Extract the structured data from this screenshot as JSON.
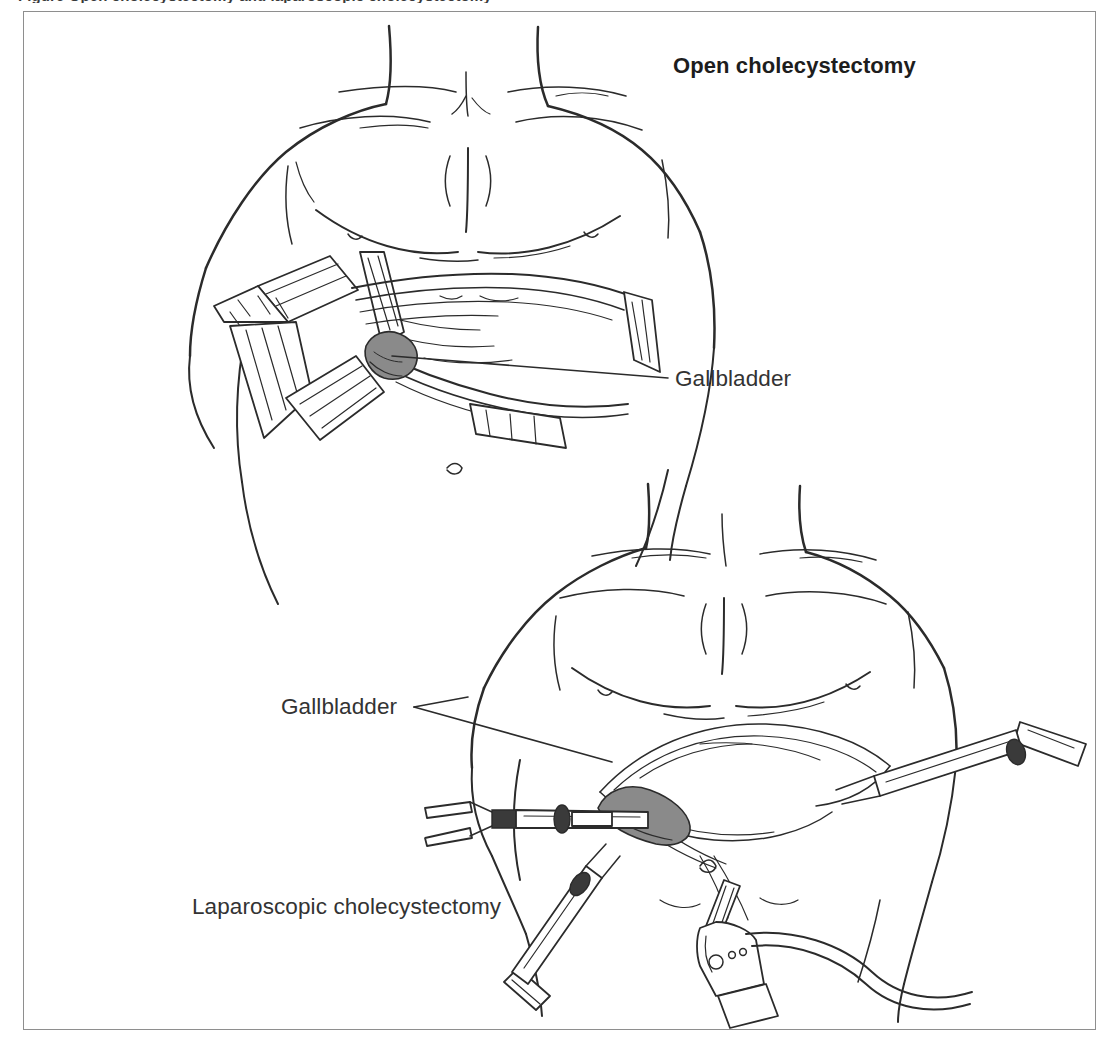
{
  "figure": {
    "caption_partial": "Figure  Open cholecystectomy and laparoscopic cholecystectomy",
    "background_color": "#ffffff",
    "frame_color": "#8e8e8e",
    "ink_color": "#262626",
    "organ_shade_color": "#8a8a8a"
  },
  "panels": {
    "open": {
      "title": "Open cholecystectomy",
      "title_weight": "bold",
      "callout": {
        "label": "Gallbladder",
        "leader_from": [
          392,
          356
        ],
        "leader_to": [
          668,
          378
        ]
      }
    },
    "laparoscopic": {
      "title": "Laparoscopic cholecystectomy",
      "title_weight": "regular",
      "callout": {
        "label": "Gallbladder",
        "leader_from": [
          414,
          707
        ],
        "leader_to": [
          612,
          762
        ]
      }
    }
  },
  "icons": {
    "torso": "torso-line-art-icon",
    "retractor": "surgical-retractor-icon",
    "trocar": "trocar-port-icon",
    "grasper": "laparoscopic-grasper-icon",
    "camera": "laparoscope-camera-head-icon",
    "cable": "camera-cable-icon",
    "gallbladder": "gallbladder-icon",
    "liver": "liver-icon"
  }
}
